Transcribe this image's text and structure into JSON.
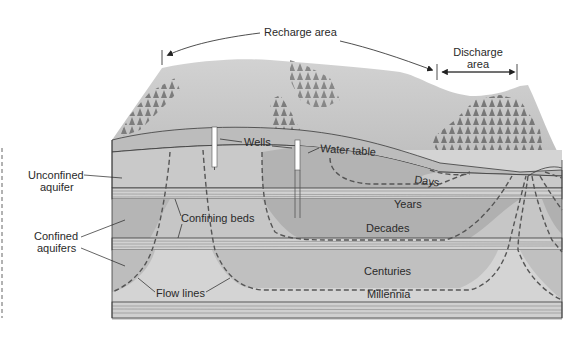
{
  "diagram": {
    "top_labels": {
      "recharge_area": "Recharge area",
      "discharge_area_line1": "Discharge",
      "discharge_area_line2": "area"
    },
    "left_labels": {
      "unconfined_line1": "Unconfined",
      "unconfined_line2": "aquifer",
      "confined_line1": "Confined",
      "confined_line2": "aquifers"
    },
    "inner_labels": {
      "wells": "Wells",
      "water_table": "Water table",
      "confining_beds": "Confining beds",
      "flow_lines": "Flow lines"
    },
    "travel_time_zones": [
      {
        "label": "Days"
      },
      {
        "label": "Years"
      },
      {
        "label": "Decades"
      },
      {
        "label": "Centuries"
      },
      {
        "label": "Millennia"
      }
    ],
    "colors": {
      "land_surface": "#c8c8c8",
      "aquifer_light": "#d6d6d6",
      "aquifer_mid": "#bdbdbd",
      "aquifer_dark": "#a9a9a9",
      "confining_bed": "#cfcfcf",
      "flow_line": "#5a5a5a",
      "tree": "#6d6d6d"
    }
  }
}
